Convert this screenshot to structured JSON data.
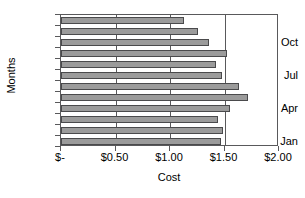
{
  "chart_data": {
    "type": "bar",
    "orientation": "horizontal",
    "title": "",
    "xlabel": "Cost",
    "ylabel": "Months",
    "xlim": [
      0,
      2
    ],
    "ylim_categories": 12,
    "grid": true,
    "legend": false,
    "categories": [
      "Jan",
      "Feb",
      "Mar",
      "Apr",
      "May",
      "Jun",
      "Jul",
      "Aug",
      "Sep",
      "Oct",
      "Nov",
      "Dec"
    ],
    "category_labels_shown": [
      "Jan",
      "Apr",
      "Jul",
      "Oct"
    ],
    "values": [
      1.47,
      1.49,
      1.44,
      1.55,
      1.72,
      1.63,
      1.48,
      1.42,
      1.52,
      1.36,
      1.26,
      1.13
    ],
    "xticks": [
      0,
      0.5,
      1.0,
      1.5,
      2.0
    ],
    "xtick_labels": [
      "$-",
      "$0.50",
      "$1.00",
      "$1.50",
      "$2.00"
    ],
    "bar_fill_color": "#9b9b9b",
    "bar_border_color": "#4a4a4c",
    "axis_color": "#59595b",
    "background_color": "#ffffff"
  }
}
